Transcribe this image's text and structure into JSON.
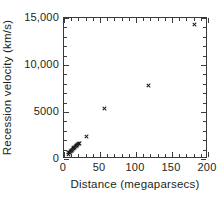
{
  "chart_data": {
    "type": "scatter",
    "title": "",
    "xlabel": "Distance (megaparsecs)",
    "ylabel": "Recession velocity (km/s)",
    "xlim": [
      0,
      200
    ],
    "ylim": [
      0,
      15000
    ],
    "grid": false,
    "legend": null,
    "marker": "x",
    "marker_color": "#1a1a1a",
    "frame_color": "#3b3b3b",
    "xticks": [
      0,
      50,
      100,
      150,
      200
    ],
    "xticklabels": [
      "0",
      "50",
      "100",
      "150",
      "200"
    ],
    "xminor_step": 10,
    "yticks": [
      0,
      5000,
      10000,
      15000
    ],
    "yticklabels": [
      "0",
      "5000",
      "10,000",
      "15,000"
    ],
    "yminor_step": 1000,
    "points": [
      {
        "x": 6,
        "y": 520
      },
      {
        "x": 7,
        "y": 650
      },
      {
        "x": 8,
        "y": 700
      },
      {
        "x": 9,
        "y": 780
      },
      {
        "x": 10,
        "y": 900
      },
      {
        "x": 11,
        "y": 950
      },
      {
        "x": 12,
        "y": 1020
      },
      {
        "x": 13,
        "y": 1100
      },
      {
        "x": 14,
        "y": 1180
      },
      {
        "x": 15,
        "y": 1250
      },
      {
        "x": 16,
        "y": 1320
      },
      {
        "x": 17,
        "y": 1400
      },
      {
        "x": 18,
        "y": 1450
      },
      {
        "x": 19,
        "y": 1520
      },
      {
        "x": 20,
        "y": 1600
      },
      {
        "x": 22,
        "y": 1700
      },
      {
        "x": 31,
        "y": 2350
      },
      {
        "x": 57,
        "y": 5400
      },
      {
        "x": 117,
        "y": 7850
      },
      {
        "x": 182,
        "y": 14300
      }
    ]
  }
}
